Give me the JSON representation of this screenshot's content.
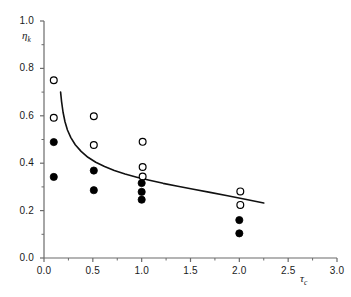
{
  "chart_data": {
    "type": "scatter",
    "title": "",
    "xlabel": "τc",
    "ylabel": "ηk",
    "xlabel_base": "τ",
    "xlabel_sub": "c",
    "ylabel_base": "η",
    "ylabel_sub": "k",
    "xlim": [
      0.0,
      3.0
    ],
    "ylim": [
      0.0,
      1.0
    ],
    "xticks": [
      0.0,
      0.5,
      1.0,
      1.5,
      2.0,
      2.5,
      3.0
    ],
    "xtick_labels": [
      "0.0",
      "0.5",
      "1.0",
      "1.5",
      "2.0",
      "2.5",
      "3.0"
    ],
    "yticks": [
      0.0,
      0.2,
      0.4,
      0.6,
      0.8,
      1.0
    ],
    "ytick_labels": [
      "0.0",
      "0.2",
      "0.4",
      "0.6",
      "0.8",
      "1.0"
    ],
    "x_minor_ticks": [
      0.25,
      0.75,
      1.25,
      1.75,
      2.25,
      2.75
    ],
    "y_minor_ticks": [
      0.1,
      0.3,
      0.5,
      0.7,
      0.9
    ],
    "grid": false,
    "legend": "none",
    "axis_color": "#6b6b6b",
    "marker_color": "#000000",
    "curve_color": "#111111",
    "series": [
      {
        "name": "open-circles",
        "marker": "open-circle",
        "points": [
          {
            "x": 0.1,
            "y": 0.75
          },
          {
            "x": 0.1,
            "y": 0.592
          },
          {
            "x": 0.51,
            "y": 0.598
          },
          {
            "x": 0.51,
            "y": 0.477
          },
          {
            "x": 1.01,
            "y": 0.49
          },
          {
            "x": 1.01,
            "y": 0.384
          },
          {
            "x": 1.01,
            "y": 0.344
          },
          {
            "x": 2.01,
            "y": 0.281
          },
          {
            "x": 2.01,
            "y": 0.224
          }
        ]
      },
      {
        "name": "filled-circles",
        "marker": "filled-circle",
        "points": [
          {
            "x": 0.1,
            "y": 0.489
          },
          {
            "x": 0.1,
            "y": 0.342
          },
          {
            "x": 0.51,
            "y": 0.369
          },
          {
            "x": 0.51,
            "y": 0.286
          },
          {
            "x": 1.0,
            "y": 0.316
          },
          {
            "x": 1.0,
            "y": 0.279
          },
          {
            "x": 1.0,
            "y": 0.246
          },
          {
            "x": 2.0,
            "y": 0.16
          },
          {
            "x": 2.0,
            "y": 0.104
          }
        ]
      }
    ],
    "curve": {
      "name": "fit-curve",
      "description": "decaying fit curve",
      "x_range": [
        0.17,
        2.25
      ],
      "points": [
        {
          "x": 0.17,
          "y": 0.7
        },
        {
          "x": 0.18,
          "y": 0.66
        },
        {
          "x": 0.195,
          "y": 0.615
        },
        {
          "x": 0.215,
          "y": 0.575
        },
        {
          "x": 0.24,
          "y": 0.54
        },
        {
          "x": 0.275,
          "y": 0.508
        },
        {
          "x": 0.32,
          "y": 0.478
        },
        {
          "x": 0.38,
          "y": 0.45
        },
        {
          "x": 0.45,
          "y": 0.425
        },
        {
          "x": 0.53,
          "y": 0.404
        },
        {
          "x": 0.62,
          "y": 0.386
        },
        {
          "x": 0.72,
          "y": 0.369
        },
        {
          "x": 0.83,
          "y": 0.354
        },
        {
          "x": 0.95,
          "y": 0.341
        },
        {
          "x": 1.08,
          "y": 0.328
        },
        {
          "x": 1.22,
          "y": 0.315
        },
        {
          "x": 1.37,
          "y": 0.303
        },
        {
          "x": 1.53,
          "y": 0.29
        },
        {
          "x": 1.7,
          "y": 0.277
        },
        {
          "x": 1.88,
          "y": 0.263
        },
        {
          "x": 2.06,
          "y": 0.248
        },
        {
          "x": 2.25,
          "y": 0.232
        }
      ]
    }
  }
}
